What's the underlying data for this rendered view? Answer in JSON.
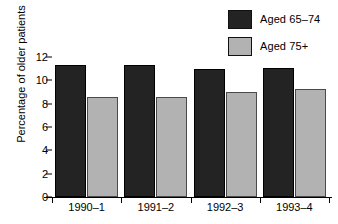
{
  "chart_data": {
    "type": "bar",
    "title": "",
    "xlabel": "",
    "ylabel": "Percentage of older patients",
    "categories": [
      "1990–1",
      "1991–2",
      "1992–3",
      "1993–4"
    ],
    "series": [
      {
        "name": "Aged 65–74",
        "color": "#232323",
        "values": [
          11.3,
          11.3,
          11.0,
          11.1
        ]
      },
      {
        "name": "Aged 75+",
        "color": "#b2b2b2",
        "values": [
          8.6,
          8.6,
          9.0,
          9.3
        ]
      }
    ],
    "ylim": [
      0,
      12
    ],
    "yticks": [
      0,
      2,
      4,
      6,
      8,
      10,
      12
    ],
    "ytick_labels": [
      "0",
      "2",
      "4",
      "6",
      "8",
      "10",
      "12"
    ],
    "grid": false,
    "legend_position": "top-right",
    "orientation": "vertical",
    "grouped": true
  },
  "legend": {
    "items": [
      {
        "label": "Aged 65–74",
        "swatch": "dark"
      },
      {
        "label": "Aged 75+",
        "swatch": "gray"
      }
    ]
  },
  "axes": {
    "y_title": "Percentage of older patients"
  }
}
